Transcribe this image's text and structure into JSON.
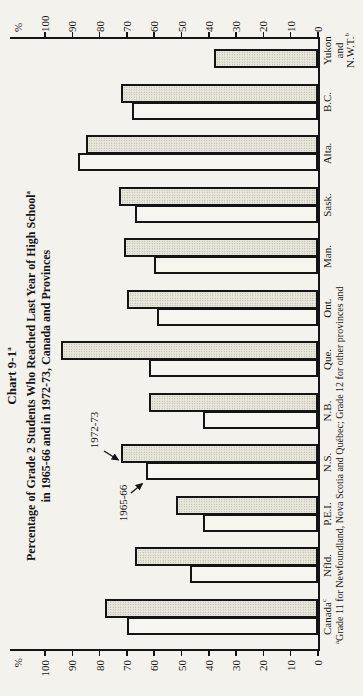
{
  "chart_data": {
    "type": "bar",
    "title": {
      "text": "Chart 9-1",
      "sup": "a"
    },
    "subtitle_line1": {
      "text": "Percentage of Grade 2 Students Who Reached Last Year of High School",
      "sup": "a"
    },
    "subtitle_line2": {
      "text": "in 1965-66 and in 1972-73, Canada and Provinces"
    },
    "axis_unit": "%",
    "ylim": [
      0,
      100
    ],
    "y_ticks": [
      0,
      10,
      20,
      30,
      40,
      50,
      60,
      70,
      80,
      90,
      100
    ],
    "grid": "off",
    "layout_note": "chart rotated 90deg CCW on page; category axis on right edge, percent axes top and bottom",
    "categories": [
      {
        "lines": [
          {
            "text": "Canada",
            "sup": "c"
          }
        ]
      },
      {
        "lines": [
          {
            "text": "Nfld."
          }
        ]
      },
      {
        "lines": [
          {
            "text": "P.E.I."
          }
        ]
      },
      {
        "lines": [
          {
            "text": "N.S."
          }
        ]
      },
      {
        "lines": [
          {
            "text": "N.B."
          }
        ]
      },
      {
        "lines": [
          {
            "text": "Que."
          }
        ]
      },
      {
        "lines": [
          {
            "text": "Ont."
          }
        ]
      },
      {
        "lines": [
          {
            "text": "Man."
          }
        ]
      },
      {
        "lines": [
          {
            "text": "Sask."
          }
        ]
      },
      {
        "lines": [
          {
            "text": "Alta."
          }
        ]
      },
      {
        "lines": [
          {
            "text": "B.C."
          }
        ]
      },
      {
        "lines": [
          {
            "text": "Yukon"
          },
          {
            "text": "and"
          },
          {
            "text": "N.W.T.",
            "sup": "b"
          }
        ]
      }
    ],
    "series": [
      {
        "name": "1965-66",
        "style": "white",
        "values": [
          70,
          47,
          42,
          63,
          42,
          62,
          59,
          60,
          67,
          88,
          68,
          null
        ]
      },
      {
        "name": "1972-73",
        "style": "shaded",
        "values": [
          78,
          67,
          52,
          72,
          62,
          94,
          70,
          71,
          73,
          85,
          72,
          38
        ]
      }
    ],
    "annotations": [
      {
        "label": "1972-73",
        "points_to": "N.S. shaded bar"
      },
      {
        "label": "1965-66",
        "points_to": "N.S. white bar"
      }
    ],
    "footnote": {
      "sup": "a",
      "text": "Grade 11 for Newfoundland, Nova Scotia and Québec; Grade 12 for other provinces and"
    },
    "colors": {
      "paper": "#f4f2ec",
      "ink": "#141414",
      "bar_white_fill": "#f7f5ef",
      "bar_shaded_fill": "#e9e6db",
      "bar_shaded_dots": "#a49f90"
    }
  }
}
